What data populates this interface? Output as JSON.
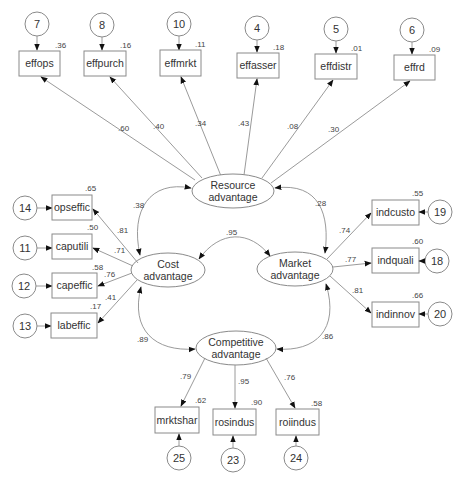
{
  "diagram": {
    "type": "structural-equation-model-path-diagram",
    "latents": {
      "resource": {
        "line1": "Resource",
        "line2": "advantage"
      },
      "cost": {
        "line1": "Cost",
        "line2": "advantage"
      },
      "market": {
        "line1": "Market",
        "line2": "advantage"
      },
      "competitive": {
        "line1": "Competitive",
        "line2": "advantage"
      }
    },
    "resource_indicators": [
      {
        "name": "effops",
        "error": "7",
        "r2": ".36",
        "loading": ".60"
      },
      {
        "name": "effpurch",
        "error": "8",
        "r2": ".16",
        "loading": ".40"
      },
      {
        "name": "effmrkt",
        "error": "10",
        "r2": ".11",
        "loading": ".34"
      },
      {
        "name": "effasser",
        "error": "4",
        "r2": ".18",
        "loading": ".43"
      },
      {
        "name": "effdistr",
        "error": "5",
        "r2": ".01",
        "loading": ".08"
      },
      {
        "name": "effrd",
        "error": "6",
        "r2": ".09",
        "loading": ".30"
      }
    ],
    "cost_indicators": [
      {
        "name": "opseffic",
        "error": "14",
        "r2": ".65",
        "loading": ".81"
      },
      {
        "name": "caputili",
        "error": "11",
        "r2": ".50",
        "loading": ".71"
      },
      {
        "name": "capeffic",
        "error": "12",
        "r2": ".58",
        "loading": ".76"
      },
      {
        "name": "labeffic",
        "error": "13",
        "r2": ".17",
        "loading": ".41"
      }
    ],
    "market_indicators": [
      {
        "name": "indcusto",
        "error": "19",
        "r2": ".55",
        "loading": ".74"
      },
      {
        "name": "indquali",
        "error": "18",
        "r2": ".60",
        "loading": ".77"
      },
      {
        "name": "indinnov",
        "error": "20",
        "r2": ".66",
        "loading": ".81"
      }
    ],
    "competitive_indicators": [
      {
        "name": "mrktshar",
        "error": "25",
        "r2": ".62",
        "loading": ".79"
      },
      {
        "name": "rosindus",
        "error": "23",
        "r2": ".90",
        "loading": ".95"
      },
      {
        "name": "roiindus",
        "error": "24",
        "r2": ".58",
        "loading": ".76"
      }
    ],
    "correlations": {
      "resource_cost": ".38",
      "resource_market": ".28",
      "cost_market": ".95",
      "cost_competitive": ".89",
      "market_competitive": ".86"
    }
  }
}
